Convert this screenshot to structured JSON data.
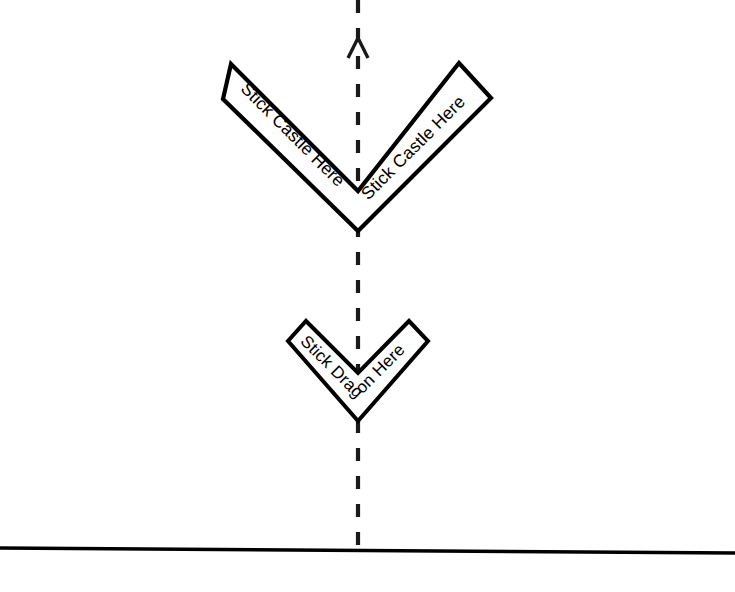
{
  "page": {
    "background_color": "#ffffff",
    "width": 735,
    "height": 592,
    "line_color": "#000000"
  },
  "markers": {
    "castle": {
      "label": "Stick Castle Here",
      "left_arm_label": "Stick Castle Here",
      "right_arm_label": "Stick Castle Here",
      "shape": "chevron-v",
      "size": "large",
      "apex_x": 358,
      "apex_y": 232
    },
    "dragon": {
      "label": "Stick Dragon Here",
      "shape": "chevron-v",
      "size": "small",
      "apex_x": 358,
      "apex_y": 422
    }
  },
  "centerline": {
    "name": "vertical dashed axis",
    "style": "dashed",
    "x": 358,
    "from_y": 0,
    "to_y": 552,
    "color": "#1a1a1a"
  },
  "arrow": {
    "name": "north direction arrowhead",
    "direction": "up",
    "tip_x": 358,
    "tip_y": 38,
    "color": "#1a1a1a"
  },
  "baseline": {
    "name": "horizontal ground line",
    "from_x": 0,
    "from_y": 548,
    "to_x": 735,
    "to_y": 553,
    "color": "#000000"
  }
}
